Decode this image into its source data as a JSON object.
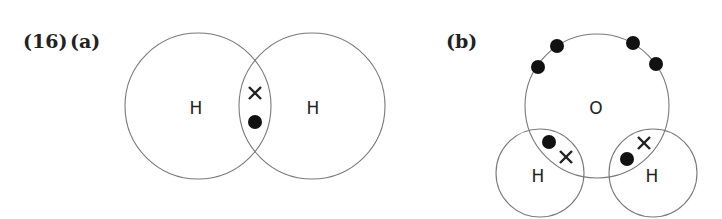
{
  "question_label": "(16)",
  "part_a": {
    "label": "(a)",
    "molecule": "H2",
    "atoms": [
      {
        "symbol": "H",
        "cx": 198,
        "cy": 106,
        "r": 73
      },
      {
        "symbol": "H",
        "cx": 312,
        "cy": 106,
        "r": 73
      }
    ],
    "shared_electrons": [
      {
        "type": "cross",
        "x": 255,
        "y": 93
      },
      {
        "type": "dot",
        "x": 255,
        "y": 122
      }
    ]
  },
  "part_b": {
    "label": "(b)",
    "molecule": "H2O",
    "atoms": [
      {
        "symbol": "O",
        "cx": 597,
        "cy": 106,
        "r": 72
      },
      {
        "symbol": "H",
        "cx": 540,
        "cy": 173,
        "r": 44
      },
      {
        "symbol": "H",
        "cx": 653,
        "cy": 173,
        "r": 44
      }
    ],
    "lone_pair_electrons": [
      {
        "type": "dot",
        "x": 557,
        "y": 46
      },
      {
        "type": "dot",
        "x": 538,
        "y": 67
      },
      {
        "type": "dot",
        "x": 633,
        "y": 43
      },
      {
        "type": "dot",
        "x": 656,
        "y": 64
      }
    ],
    "shared_electrons": [
      {
        "type": "dot",
        "x": 549,
        "y": 142
      },
      {
        "type": "cross",
        "x": 566,
        "y": 157
      },
      {
        "type": "cross",
        "x": 644,
        "y": 143
      },
      {
        "type": "dot",
        "x": 627,
        "y": 159
      }
    ]
  }
}
